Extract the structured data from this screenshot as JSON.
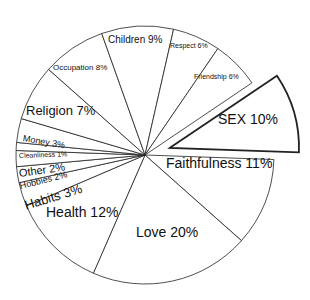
{
  "chart_data": {
    "type": "pie",
    "title": "",
    "exploded": [
      "SEX"
    ],
    "categories": [
      "Faithfulness",
      "Love",
      "Health",
      "Habits",
      "Hobbies",
      "Other",
      "Cleanliness",
      "Money",
      "Religion",
      "Occupation",
      "Children",
      "Respect",
      "Friendship",
      "SEX"
    ],
    "values": [
      11,
      20,
      12,
      3,
      2,
      2,
      1,
      3,
      7,
      8,
      9,
      6,
      6,
      10
    ],
    "labels": [
      "Faithfulness 11%",
      "Love 20%",
      "Health 12%",
      "Habits 3%",
      "Hobbies 2%",
      "Other 2%",
      "Cleanliness 1%",
      "Money 3%",
      "Religion 7%",
      "Occupation 8%",
      "Children 9%",
      "Respect 6%",
      "Friendship 6%",
      "SEX 10%"
    ],
    "colors": {
      "fill": "#ffffff",
      "stroke": "#222222",
      "text": "#111111"
    }
  }
}
